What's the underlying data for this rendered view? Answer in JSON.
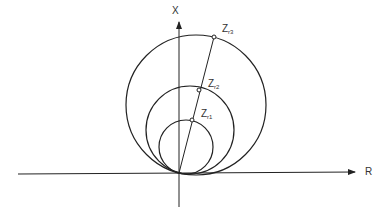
{
  "diagram": {
    "axes": {
      "horizontal_label": "R",
      "vertical_label": "X"
    },
    "points": [
      {
        "name": "Z",
        "sub": "r1"
      },
      {
        "name": "Z",
        "sub": "r2"
      },
      {
        "name": "Z",
        "sub": "r3"
      }
    ],
    "colors": {
      "stroke": "#222222",
      "text": "#333333",
      "background": "#ffffff"
    }
  }
}
